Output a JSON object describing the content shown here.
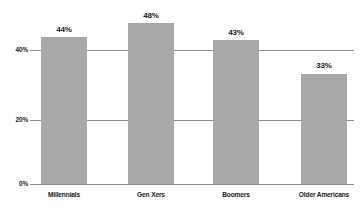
{
  "chart_data": {
    "type": "bar",
    "title": "",
    "xlabel": "",
    "ylabel": "",
    "categories": [
      "Millennials",
      "Gen Xers",
      "Boomers",
      "Older Americans"
    ],
    "values": [
      44,
      48,
      43,
      33
    ],
    "value_labels": [
      "44%",
      "48%",
      "43%",
      "33%"
    ],
    "ylim": [
      0,
      60
    ],
    "yticks": [
      0,
      20,
      40
    ],
    "ytick_labels": [
      "0%",
      "20%",
      "40%"
    ],
    "grid": true,
    "legend": "none",
    "colors": {
      "bar_fill": "#a8a8a8",
      "gridline": "#8e8e8e",
      "text": "#1a1a1a",
      "background": "#ffffff"
    }
  },
  "axis": {
    "ytick_0": "0%",
    "ytick_20": "20%",
    "ytick_40": "40%"
  },
  "bars": [
    {
      "label": "Millennials",
      "value_label": "44%",
      "value": 44
    },
    {
      "label": "Gen Xers",
      "value_label": "48%",
      "value": 48
    },
    {
      "label": "Boomers",
      "value_label": "43%",
      "value": 43
    },
    {
      "label": "Older Americans",
      "value_label": "33%",
      "value": 33
    }
  ]
}
